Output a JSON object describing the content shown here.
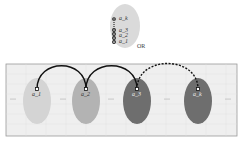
{
  "top_stack": {
    "labels": [
      "a_k",
      "a_3",
      "a_2",
      "a_1"
    ],
    "ellipse_color": "#d9d9d9"
  },
  "or_label": "OR",
  "panel": {
    "background": "#efefef",
    "border": "#9a9a9a",
    "ellipsis": "...",
    "nodes": [
      {
        "label": "a_1",
        "color": "#d4d4d4"
      },
      {
        "label": "a_2",
        "color": "#b3b3b3"
      },
      {
        "label": "a_3",
        "color": "#6e6e6e"
      },
      {
        "label": "a_k",
        "color": "#6e6e6e"
      }
    ],
    "arcs": [
      {
        "from": "a_1",
        "to": "a_2",
        "style": "solid"
      },
      {
        "from": "a_2",
        "to": "a_3",
        "style": "solid"
      },
      {
        "from": "a_3",
        "to": "a_k",
        "style": "dashed"
      }
    ]
  }
}
